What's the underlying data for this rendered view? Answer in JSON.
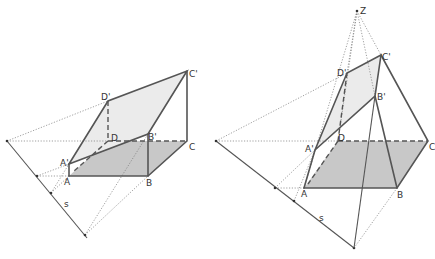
{
  "figures": [
    {
      "id": "parallel-projection",
      "labels": {
        "A": "A",
        "B": "B",
        "C": "C",
        "D": "D",
        "A1": "A'",
        "B1": "B'",
        "C1": "C'",
        "D1": "D'",
        "s": "s"
      }
    },
    {
      "id": "central-projection",
      "labels": {
        "A": "A",
        "B": "B",
        "C": "C",
        "D": "D",
        "A1": "A'",
        "B1": "B'",
        "C1": "C'",
        "D1": "D'",
        "s": "s",
        "Z": "Z"
      }
    }
  ],
  "colors": {
    "base_fill": "#c8c8c8",
    "section_fill": "#ebebeb",
    "line": "#555555"
  }
}
